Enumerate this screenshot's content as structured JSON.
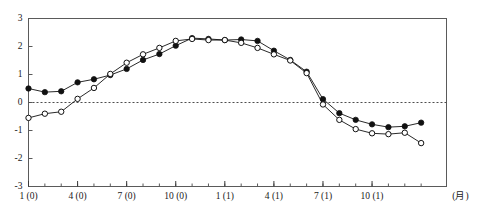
{
  "chart_data": {
    "type": "line",
    "title": "",
    "subtitle": "",
    "xlabel": "(月)",
    "ylabel": "",
    "ylim": [
      -3,
      3
    ],
    "yticks": [
      3,
      2,
      1,
      0,
      -1,
      -2,
      -3
    ],
    "ytick_labels": [
      "3",
      "2",
      "1",
      "0",
      "-1",
      "-2",
      "-3"
    ],
    "grid": false,
    "zero_line": 0,
    "zero_line_style": "dashed",
    "legend_position": "none",
    "x_major_labels": [
      "1 (0)",
      "4 (0)",
      "7 (0)",
      "10 (0)",
      "1 (1)",
      "4 (1)",
      "7 (1)",
      "10 (1)"
    ],
    "x_major_index": [
      0,
      3,
      6,
      9,
      12,
      15,
      18,
      21
    ],
    "x_minor_count": 25,
    "x": [
      1,
      2,
      3,
      4,
      5,
      6,
      7,
      8,
      9,
      10,
      11,
      12,
      13,
      14,
      15,
      16,
      17,
      18,
      19,
      20,
      21,
      22,
      23,
      24,
      25
    ],
    "series": [
      {
        "name": "series-filled",
        "marker": "filled-circle",
        "color": "#111111",
        "line_style": "solid",
        "values": [
          0.5,
          0.37,
          0.4,
          0.72,
          0.83,
          0.98,
          1.2,
          1.52,
          1.73,
          2.03,
          2.3,
          2.27,
          2.23,
          2.25,
          2.2,
          1.85,
          1.52,
          1.1,
          0.12,
          -0.38,
          -0.62,
          -0.78,
          -0.88,
          -0.85,
          -0.72
        ]
      },
      {
        "name": "series-open",
        "marker": "open-circle",
        "color": "#111111",
        "line_style": "solid",
        "values": [
          -0.55,
          -0.4,
          -0.33,
          0.13,
          0.52,
          1.02,
          1.42,
          1.72,
          1.95,
          2.2,
          2.27,
          2.23,
          2.23,
          2.13,
          1.95,
          1.72,
          1.5,
          1.05,
          -0.07,
          -0.62,
          -0.95,
          -1.1,
          -1.13,
          -1.08,
          -1.45
        ]
      }
    ]
  }
}
